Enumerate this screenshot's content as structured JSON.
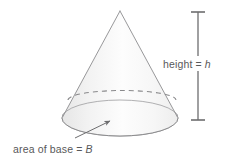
{
  "figure": {
    "type": "geometry-diagram",
    "labels": {
      "height": {
        "text_plain": "height = h",
        "word": "height",
        "equals": "=",
        "variable": "h",
        "variable_style": "italic"
      },
      "base": {
        "text_plain": "area of base = B",
        "word": "area of base",
        "equals": "=",
        "variable": "B",
        "variable_style": "italic"
      }
    },
    "colors": {
      "outline": "#8c8c8e",
      "dashed_rim": "#8c8c8e",
      "fill_light": "#fafafa",
      "fill_shade": "#ececec",
      "text": "#58585a",
      "measure_line": "#6d6d6f",
      "arrow": "#6d6d6f",
      "background": "#ffffff"
    },
    "geometry": {
      "apex_x": 120,
      "apex_y": 11,
      "base_center_x": 120,
      "base_center_y": 118,
      "base_radius_x": 58,
      "base_radius_y": 18,
      "hidden_rim_center_y": 100,
      "hidden_rim_radius_y": 9,
      "measure_line_x": 198,
      "measure_top_y": 12,
      "measure_bottom_y": 120,
      "measure_cap_half_width": 7,
      "arrow_tail_x": 75,
      "arrow_tail_y": 138,
      "arrow_head_x": 110,
      "arrow_head_y": 121
    }
  }
}
